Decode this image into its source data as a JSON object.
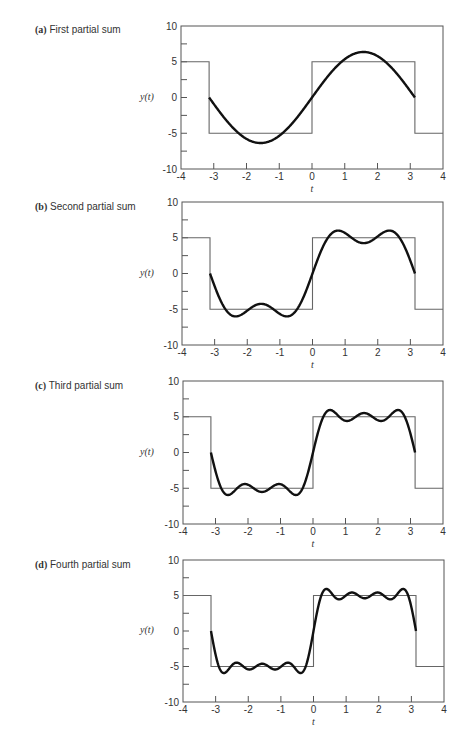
{
  "chart_data": [
    {
      "type": "line",
      "title": "(a) First partial sum",
      "label": "(a)",
      "subtitle": "First partial sum",
      "xlabel": "t",
      "ylabel": "y(t)",
      "xlim": [
        -4,
        4
      ],
      "ylim": [
        -10,
        10
      ],
      "xticks": [
        -4,
        -3,
        -2,
        -1,
        0,
        1,
        2,
        3,
        4
      ],
      "yticks": [
        -10,
        -5,
        0,
        5,
        10
      ],
      "grid": false,
      "terms": 1,
      "series": [
        {
          "name": "square wave",
          "style": "thin gray",
          "x": [
            -4,
            -3.1416,
            -3.1416,
            0,
            0,
            3.1416,
            3.1416,
            4
          ],
          "y": [
            5,
            5,
            -5,
            -5,
            5,
            5,
            -5,
            -5
          ]
        },
        {
          "name": "partial sum (1 term)",
          "style": "thick black",
          "formula": "(20/pi)*sin(t)",
          "x_range": [
            -3.1416,
            3.1416
          ],
          "peak": 6.37
        }
      ]
    },
    {
      "type": "line",
      "title": "(b) Second partial sum",
      "label": "(b)",
      "subtitle": "Second partial sum",
      "xlabel": "t",
      "ylabel": "y(t)",
      "xlim": [
        -4,
        4
      ],
      "ylim": [
        -10,
        10
      ],
      "xticks": [
        -4,
        -3,
        -2,
        -1,
        0,
        1,
        2,
        3,
        4
      ],
      "yticks": [
        -10,
        -5,
        0,
        5,
        10
      ],
      "grid": false,
      "terms": 2,
      "series": [
        {
          "name": "square wave",
          "style": "thin gray",
          "x": [
            -4,
            -3.1416,
            -3.1416,
            0,
            0,
            3.1416,
            3.1416,
            4
          ],
          "y": [
            5,
            5,
            -5,
            -5,
            5,
            5,
            -5,
            -5
          ]
        },
        {
          "name": "partial sum (2 terms)",
          "style": "thick black",
          "formula": "(20/pi)*(sin(t)+sin(3t)/3)",
          "x_range": [
            -3.1416,
            3.1416
          ],
          "peak": 6.0
        }
      ]
    },
    {
      "type": "line",
      "title": "(c) Third partial sum",
      "label": "(c)",
      "subtitle": "Third partial sum",
      "xlabel": "t",
      "ylabel": "y(t)",
      "xlim": [
        -4,
        4
      ],
      "ylim": [
        -10,
        10
      ],
      "xticks": [
        -4,
        -3,
        -2,
        -1,
        0,
        1,
        2,
        3,
        4
      ],
      "yticks": [
        -10,
        -5,
        0,
        5,
        10
      ],
      "grid": false,
      "terms": 3,
      "series": [
        {
          "name": "square wave",
          "style": "thin gray",
          "x": [
            -4,
            -3.1416,
            -3.1416,
            0,
            0,
            3.1416,
            3.1416,
            4
          ],
          "y": [
            5,
            5,
            -5,
            -5,
            5,
            5,
            -5,
            -5
          ]
        },
        {
          "name": "partial sum (3 terms)",
          "style": "thick black",
          "formula": "(20/pi)*(sin(t)+sin(3t)/3+sin(5t)/5)",
          "x_range": [
            -3.1416,
            3.1416
          ],
          "peak": 6.2
        }
      ]
    },
    {
      "type": "line",
      "title": "(d) Fourth partial sum",
      "label": "(d)",
      "subtitle": "Fourth partial sum",
      "xlabel": "t",
      "ylabel": "y(t)",
      "xlim": [
        -4,
        4
      ],
      "ylim": [
        -10,
        10
      ],
      "xticks": [
        -4,
        -3,
        -2,
        -1,
        0,
        1,
        2,
        3,
        4
      ],
      "yticks": [
        -10,
        -5,
        0,
        5,
        10
      ],
      "grid": false,
      "terms": 4,
      "series": [
        {
          "name": "square wave",
          "style": "thin gray",
          "x": [
            -4,
            -3.1416,
            -3.1416,
            0,
            0,
            3.1416,
            3.1416,
            4
          ],
          "y": [
            5,
            5,
            -5,
            -5,
            5,
            5,
            -5,
            -5
          ]
        },
        {
          "name": "partial sum (4 terms)",
          "style": "thick black",
          "formula": "(20/pi)*(sin(t)+sin(3t)/3+sin(5t)/5+sin(7t)/7)",
          "x_range": [
            -3.1416,
            3.1416
          ],
          "peak": 6.1
        }
      ]
    }
  ],
  "panels": [
    {
      "label": "(a)",
      "subtitle": "First partial sum",
      "ylabel": "y(t)",
      "xlabel": "t"
    },
    {
      "label": "(b)",
      "subtitle": "Second partial sum",
      "ylabel": "y(t)",
      "xlabel": "t"
    },
    {
      "label": "(c)",
      "subtitle": "Third partial sum",
      "ylabel": "y(t)",
      "xlabel": "t"
    },
    {
      "label": "(d)",
      "subtitle": "Fourth partial sum",
      "ylabel": "y(t)",
      "xlabel": "t"
    }
  ],
  "colors": {
    "axis": "#555555",
    "square_wave": "#666666",
    "partial_sum": "#111111",
    "text": "#333333"
  }
}
